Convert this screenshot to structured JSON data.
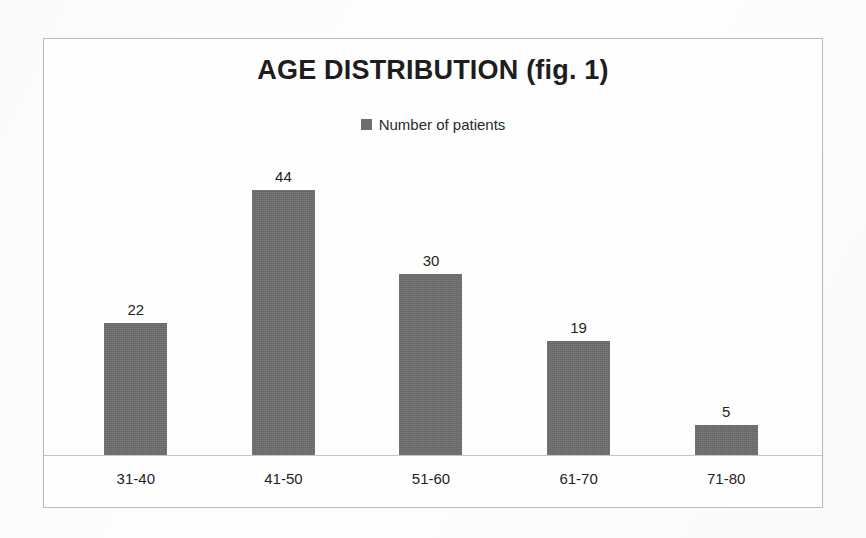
{
  "chart_data": {
    "type": "bar",
    "title": "AGE DISTRIBUTION (fig. 1)",
    "categories": [
      "31-40",
      "41-50",
      "51-60",
      "61-70",
      "71-80"
    ],
    "values": [
      22,
      44,
      30,
      19,
      5
    ],
    "series": [
      {
        "name": "Number of patients",
        "values": [
          22,
          44,
          30,
          19,
          5
        ]
      }
    ],
    "legend": {
      "position": "top-center",
      "entries": [
        {
          "label": "Number of patients",
          "color": "#6e6e6e",
          "marker": "square"
        }
      ]
    },
    "data_labels": [
      "22",
      "44",
      "30",
      "19",
      "5"
    ],
    "xlabel": "",
    "ylabel": "",
    "ylim": [
      0,
      48
    ],
    "grid": false,
    "axis": {
      "y_axis_visible": false,
      "x_axis_visible": true,
      "tick_labels_y": []
    },
    "bar_color": "#6d6d6d"
  },
  "frame": {
    "border_color": "#b9b9b9",
    "background": "#fefefe"
  }
}
